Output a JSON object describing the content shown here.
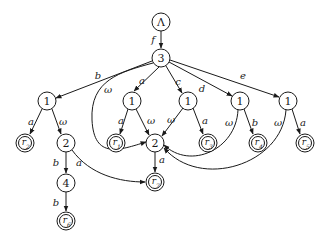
{
  "diagram": {
    "type": "automaton",
    "nodes": [
      {
        "id": "lambda",
        "label": "Λ",
        "x": 161,
        "y": 22,
        "final": false
      },
      {
        "id": "n3",
        "label": "3",
        "x": 161,
        "y": 58,
        "final": false
      },
      {
        "id": "n1a",
        "label": "1",
        "x": 47,
        "y": 101,
        "final": false
      },
      {
        "id": "n1b",
        "label": "1",
        "x": 132,
        "y": 101,
        "final": false
      },
      {
        "id": "n1c",
        "label": "1",
        "x": 188,
        "y": 101,
        "final": false
      },
      {
        "id": "n1d",
        "label": "1",
        "x": 240,
        "y": 101,
        "final": false
      },
      {
        "id": "n1e",
        "label": "1",
        "x": 288,
        "y": 101,
        "final": false
      },
      {
        "id": "r2",
        "label": "r",
        "sub": "2",
        "x": 25,
        "y": 143,
        "final": true
      },
      {
        "id": "n2a",
        "label": "2",
        "x": 66,
        "y": 143,
        "final": false
      },
      {
        "id": "r1",
        "label": "r",
        "sub": "1",
        "x": 116,
        "y": 143,
        "final": true
      },
      {
        "id": "n2b",
        "label": "2",
        "x": 155,
        "y": 143,
        "final": false
      },
      {
        "id": "r3",
        "label": "r",
        "sub": "3",
        "x": 208,
        "y": 143,
        "final": true
      },
      {
        "id": "r4",
        "label": "r",
        "sub": "4",
        "x": 258,
        "y": 143,
        "final": true
      },
      {
        "id": "r5",
        "label": "r",
        "sub": "5",
        "x": 305,
        "y": 143,
        "final": true
      },
      {
        "id": "n4",
        "label": "4",
        "x": 66,
        "y": 183,
        "final": false
      },
      {
        "id": "r7",
        "label": "r",
        "sub": "7",
        "x": 155,
        "y": 182,
        "final": true
      },
      {
        "id": "r6",
        "label": "r",
        "sub": "6",
        "x": 66,
        "y": 221,
        "final": true
      }
    ],
    "edges": [
      {
        "from": "lambda",
        "to": "n3",
        "label": "f"
      },
      {
        "from": "n3",
        "to": "n1a",
        "label": "b"
      },
      {
        "from": "n3",
        "to": "n1b",
        "label": "a"
      },
      {
        "from": "n3",
        "to": "n1c",
        "label": "c"
      },
      {
        "from": "n3",
        "to": "n1d",
        "label": "d"
      },
      {
        "from": "n3",
        "to": "n1e",
        "label": "e"
      },
      {
        "from": "n3",
        "to": "n2b",
        "label": "ω"
      },
      {
        "from": "n1a",
        "to": "r2",
        "label": "a"
      },
      {
        "from": "n1a",
        "to": "n2a",
        "label": "ω"
      },
      {
        "from": "n1b",
        "to": "r1",
        "label": "a"
      },
      {
        "from": "n1b",
        "to": "n2b",
        "label": "ω"
      },
      {
        "from": "n1c",
        "to": "n2b",
        "label": "ω"
      },
      {
        "from": "n1c",
        "to": "r3",
        "label": "a"
      },
      {
        "from": "n1d",
        "to": "n2b",
        "label": "ω"
      },
      {
        "from": "n1d",
        "to": "r4",
        "label": "b"
      },
      {
        "from": "n1e",
        "to": "n2b",
        "label": "ω"
      },
      {
        "from": "n1e",
        "to": "r5",
        "label": "a"
      },
      {
        "from": "n2a",
        "to": "n4",
        "label": "b"
      },
      {
        "from": "n2a",
        "to": "r7",
        "label": "a"
      },
      {
        "from": "n2b",
        "to": "r7",
        "label": "a"
      },
      {
        "from": "n4",
        "to": "r6",
        "label": "b"
      }
    ]
  },
  "labels": {
    "lambda": "Λ",
    "n3": "3",
    "n1": "1",
    "n2": "2",
    "n4": "4",
    "r": "r",
    "s1": "1",
    "s2": "2",
    "s3": "3",
    "s4": "4",
    "s5": "5",
    "s6": "6",
    "s7": "7",
    "f": "f",
    "a": "a",
    "b": "b",
    "c": "c",
    "d": "d",
    "e": "e",
    "omega": "ω"
  }
}
